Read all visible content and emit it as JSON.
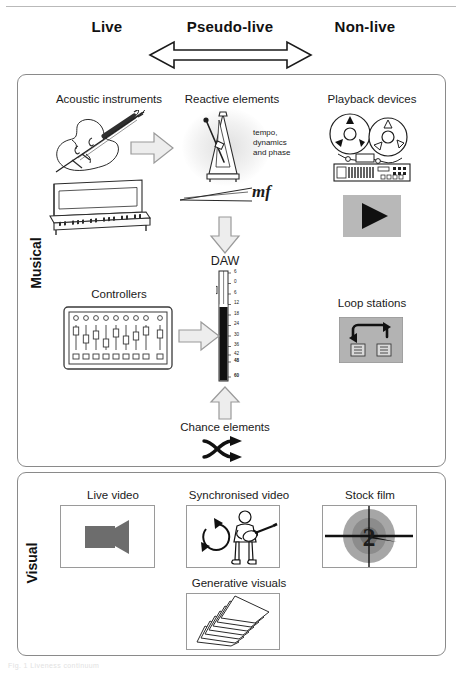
{
  "figure": {
    "top_rule": true,
    "caption": "Fig. 1 Liveness continuum"
  },
  "columns": [
    {
      "id": "live",
      "label": "Live"
    },
    {
      "id": "pseudo-live",
      "label": "Pseudo-live"
    },
    {
      "id": "non-live",
      "label": "Non-live"
    }
  ],
  "continuum_arrow": {
    "name": "double-headed-arrow",
    "direction": "bidirectional"
  },
  "bands": [
    {
      "id": "musical",
      "label": "Musical"
    },
    {
      "id": "visual",
      "label": "Visual"
    }
  ],
  "musical": {
    "acoustic_instruments": {
      "title": "Acoustic instruments",
      "icons": [
        "violin-icon",
        "upright-piano-icon"
      ]
    },
    "reactive_elements": {
      "title": "Reactive elements",
      "icons": [
        "metronome-icon",
        "crescendo-hairpin-icon"
      ],
      "note": "tempo,\ndynamics\nand phase",
      "note_lines": [
        "tempo,",
        "dynamics",
        "and phase"
      ],
      "dynamic_marking": "mf"
    },
    "playback_devices": {
      "title": "Playback devices",
      "icons": [
        "reel-to-reel-tape-icon",
        "play-button-icon"
      ]
    },
    "controllers": {
      "title": "Controllers",
      "icons": [
        "midi-fader-controller-icon"
      ]
    },
    "loop_stations": {
      "title": "Loop stations",
      "icons": [
        "loop-pedal-icon"
      ]
    },
    "daw": {
      "title": "DAW",
      "icons": [
        "channel-fader-icon"
      ],
      "meter_scale": [
        "6",
        "0",
        "6",
        "12",
        "18",
        "24",
        "30",
        "36",
        "42",
        "48",
        "60"
      ],
      "bold_scale_values": [
        "48",
        "60"
      ]
    },
    "chance_elements": {
      "title": "Chance elements",
      "icons": [
        "shuffle-icon"
      ]
    },
    "arrows": [
      {
        "name": "arrow-acoustic-to-reactive",
        "direction": "right"
      },
      {
        "name": "arrow-controllers-to-daw",
        "direction": "right"
      },
      {
        "name": "arrow-reactive-to-daw",
        "direction": "down"
      },
      {
        "name": "arrow-chance-to-daw",
        "direction": "up"
      }
    ]
  },
  "visual": {
    "live_video": {
      "title": "Live video",
      "icons": [
        "video-camera-icon"
      ]
    },
    "synchronised_video": {
      "title": "Synchronised video",
      "icons": [
        "loop-circle-arrow-icon",
        "guitarist-icon"
      ]
    },
    "stock_film": {
      "title": "Stock film",
      "icons": [
        "film-countdown-leader-icon"
      ],
      "number": "2"
    },
    "generative_visuals": {
      "title": "Generative visuals",
      "icons": [
        "stacked-cards-icon"
      ]
    }
  },
  "colors": {
    "band_border": "#8a8a8a",
    "arrow_fill": "#eeeeee",
    "arrow_stroke": "#9a9a9a",
    "meter_dark": "#111111",
    "device_grey": "#b5b5b5",
    "camera_grey": "#6d6d6d",
    "text": "#1a1a1a"
  }
}
